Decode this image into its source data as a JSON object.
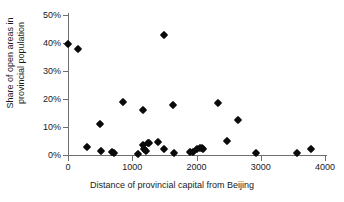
{
  "chart_data": {
    "type": "scatter",
    "title": "",
    "xlabel": "Distance of provincial capital from Beijing",
    "ylabel": "Share of open areas in provincial population",
    "ylabel_line1": "Share of open areas in",
    "ylabel_line2": "provincial population",
    "xlim": [
      0,
      4000
    ],
    "ylim": [
      0,
      50
    ],
    "xticks": [
      0,
      1000,
      2000,
      3000,
      4000
    ],
    "xtick_labels": [
      "0",
      "1000",
      "2000",
      "3000",
      "4000"
    ],
    "yticks": [
      0,
      10,
      20,
      30,
      40,
      50
    ],
    "ytick_labels": [
      "0%",
      "10%",
      "20%",
      "30%",
      "40%",
      "50%"
    ],
    "grid": false,
    "legend": false,
    "marker": "filled-diamond",
    "marker_color": "#0a0a0a",
    "axis_color": "#6e6e6e",
    "background": "#ffffff",
    "points": [
      {
        "x": 0,
        "y": 39.5
      },
      {
        "x": 150,
        "y": 37.8
      },
      {
        "x": 290,
        "y": 3.0
      },
      {
        "x": 500,
        "y": 11.0
      },
      {
        "x": 510,
        "y": 1.5
      },
      {
        "x": 680,
        "y": 1.0
      },
      {
        "x": 720,
        "y": 0.6
      },
      {
        "x": 850,
        "y": 19.0
      },
      {
        "x": 1090,
        "y": 0.5
      },
      {
        "x": 1160,
        "y": 16.0
      },
      {
        "x": 1175,
        "y": 3.4
      },
      {
        "x": 1190,
        "y": 2.0
      },
      {
        "x": 1210,
        "y": 1.4
      },
      {
        "x": 1240,
        "y": 4.2
      },
      {
        "x": 1260,
        "y": 4.4
      },
      {
        "x": 1400,
        "y": 4.8
      },
      {
        "x": 1490,
        "y": 43.0
      },
      {
        "x": 1500,
        "y": 2.0
      },
      {
        "x": 1640,
        "y": 17.8
      },
      {
        "x": 1650,
        "y": 0.6
      },
      {
        "x": 1900,
        "y": 1.1
      },
      {
        "x": 1950,
        "y": 1.2
      },
      {
        "x": 2010,
        "y": 2.2
      },
      {
        "x": 2050,
        "y": 2.4
      },
      {
        "x": 2080,
        "y": 2.4
      },
      {
        "x": 2100,
        "y": 2.3
      },
      {
        "x": 2340,
        "y": 18.4
      },
      {
        "x": 2480,
        "y": 4.9
      },
      {
        "x": 2650,
        "y": 12.5
      },
      {
        "x": 2920,
        "y": 0.6
      },
      {
        "x": 3570,
        "y": 0.6
      },
      {
        "x": 3780,
        "y": 2.0
      }
    ]
  }
}
